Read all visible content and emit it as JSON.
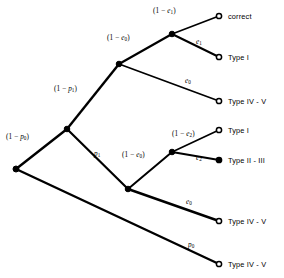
{
  "figure": {
    "type": "probability-tree",
    "title": "",
    "width": 284,
    "height": 278,
    "background": "#ffffff",
    "stroke_color": "#000000"
  },
  "nodes": [
    {
      "id": "root",
      "name": "root-node",
      "x": 16,
      "y": 169,
      "kind": "internal",
      "fill": "#000000",
      "radius": 3.0
    },
    {
      "id": "nA",
      "name": "node-after-1-minus-p0",
      "x": 67,
      "y": 129,
      "kind": "internal",
      "fill": "#000000",
      "radius": 2.8
    },
    {
      "id": "nB",
      "name": "node-after-1-minus-p1",
      "x": 119,
      "y": 64,
      "kind": "internal",
      "fill": "#000000",
      "radius": 2.8
    },
    {
      "id": "nC",
      "name": "node-after-1-minus-e0-upper",
      "x": 172,
      "y": 34,
      "kind": "internal",
      "fill": "#000000",
      "radius": 2.8
    },
    {
      "id": "nD",
      "name": "node-after-p1",
      "x": 128,
      "y": 189,
      "kind": "internal",
      "fill": "#000000",
      "radius": 2.8
    },
    {
      "id": "nE",
      "name": "node-after-1-minus-e0-lower",
      "x": 172,
      "y": 152,
      "kind": "internal",
      "fill": "#000000",
      "radius": 2.8
    },
    {
      "id": "t1",
      "name": "terminal-correct",
      "x": 219,
      "y": 16,
      "kind": "terminal",
      "fill": "#ffffff",
      "radius": 2.6
    },
    {
      "id": "t2",
      "name": "terminal-type-i-upper",
      "x": 219,
      "y": 57,
      "kind": "terminal",
      "fill": "#ffffff",
      "radius": 2.6
    },
    {
      "id": "t3",
      "name": "terminal-type-iv-v-upper",
      "x": 219,
      "y": 101,
      "kind": "terminal",
      "fill": "#ffffff",
      "radius": 2.6
    },
    {
      "id": "t4",
      "name": "terminal-type-i-lower",
      "x": 219,
      "y": 130,
      "kind": "terminal",
      "fill": "#ffffff",
      "radius": 2.6
    },
    {
      "id": "t5",
      "name": "terminal-type-ii-iii",
      "x": 219,
      "y": 160,
      "kind": "terminal",
      "fill": "#000000",
      "radius": 2.6
    },
    {
      "id": "t6",
      "name": "terminal-type-iv-v-middle",
      "x": 219,
      "y": 221,
      "kind": "terminal",
      "fill": "#ffffff",
      "radius": 2.6
    },
    {
      "id": "t7",
      "name": "terminal-type-iv-v-bottom",
      "x": 219,
      "y": 264,
      "kind": "terminal",
      "fill": "#ffffff",
      "radius": 2.6
    }
  ],
  "edges": [
    {
      "id": "e_root_nA",
      "name": "edge-root-to-node-a",
      "from": "root",
      "to": "nA",
      "width": 2.4
    },
    {
      "id": "e_root_t7",
      "name": "edge-root-to-terminal-p0",
      "from": "root",
      "to": "t7",
      "width": 2.4
    },
    {
      "id": "e_nA_nB",
      "name": "edge-node-a-to-node-b",
      "from": "nA",
      "to": "nB",
      "width": 2.4
    },
    {
      "id": "e_nA_nD",
      "name": "edge-node-a-to-node-d",
      "from": "nA",
      "to": "nD",
      "width": 2.2
    },
    {
      "id": "e_nB_nC",
      "name": "edge-node-b-to-node-c",
      "from": "nB",
      "to": "nC",
      "width": 2.2
    },
    {
      "id": "e_nB_t3",
      "name": "edge-node-b-to-type-iv-v",
      "from": "nB",
      "to": "t3",
      "width": 1.7
    },
    {
      "id": "e_nC_t1",
      "name": "edge-node-c-to-correct",
      "from": "nC",
      "to": "t1",
      "width": 1.7
    },
    {
      "id": "e_nC_t2",
      "name": "edge-node-c-to-type-i",
      "from": "nC",
      "to": "t2",
      "width": 2.0
    },
    {
      "id": "e_nD_nE",
      "name": "edge-node-d-to-node-e",
      "from": "nD",
      "to": "nE",
      "width": 2.0
    },
    {
      "id": "e_nD_t6",
      "name": "edge-node-d-to-type-iv-v",
      "from": "nD",
      "to": "t6",
      "width": 2.4
    },
    {
      "id": "e_nE_t4",
      "name": "edge-node-e-to-type-i",
      "from": "nE",
      "to": "t4",
      "width": 1.7
    },
    {
      "id": "e_nE_t5",
      "name": "edge-node-e-to-type-ii-iii",
      "from": "nE",
      "to": "t5",
      "width": 2.0
    }
  ],
  "edge_labels": [
    {
      "name": "label-1-minus-e1",
      "html": "(1 &minus; <i>e</i><sub>1</sub>)",
      "x": 153,
      "y": 8,
      "edge": "e_nC_t1"
    },
    {
      "name": "label-e1",
      "html": "<i>e</i><sub>1</sub>",
      "x": 196,
      "y": 39,
      "edge": "e_nC_t2"
    },
    {
      "name": "label-1-minus-e0-upper",
      "html": "(1 &minus; <i>e</i><sub>0</sub>)",
      "x": 107,
      "y": 35,
      "edge": "e_nB_nC"
    },
    {
      "name": "label-e0-upper",
      "html": "<i>e</i><sub>0</sub>",
      "x": 185,
      "y": 78,
      "edge": "e_nB_t3"
    },
    {
      "name": "label-1-minus-p1",
      "html": "(1 &minus; <i>p</i><sub>1</sub>)",
      "x": 54,
      "y": 86,
      "edge": "e_nA_nB"
    },
    {
      "name": "label-1-minus-p0",
      "html": "(1 &minus; <i>p</i><sub>0</sub>)",
      "x": 6,
      "y": 134,
      "edge": "e_root_nA"
    },
    {
      "name": "label-p1",
      "html": "<i>p</i><sub>1</sub>",
      "x": 94,
      "y": 151,
      "edge": "e_nA_nD"
    },
    {
      "name": "label-1-minus-e2",
      "html": "(1 &minus; <i>e</i><sub>2</sub>)",
      "x": 172,
      "y": 131,
      "edge": "e_nE_t4"
    },
    {
      "name": "label-e2",
      "html": "<i>e</i><sub>2</sub>",
      "x": 196,
      "y": 155,
      "edge": "e_nE_t5"
    },
    {
      "name": "label-1-minus-e0-lower",
      "html": "(1 &minus; <i>e</i><sub>0</sub>)",
      "x": 122,
      "y": 152,
      "edge": "e_nD_nE"
    },
    {
      "name": "label-e0-lower",
      "html": "<i>e</i><sub>0</sub>",
      "x": 186,
      "y": 199,
      "edge": "e_nD_t6"
    },
    {
      "name": "label-p0",
      "html": "<i>p</i><sub>0</sub>",
      "x": 188,
      "y": 242,
      "edge": "e_root_t7"
    }
  ],
  "terminal_labels": [
    {
      "name": "terminal-label-correct",
      "text": "correct",
      "x": 228,
      "y": 13,
      "node": "t1"
    },
    {
      "name": "terminal-label-type-i-upper",
      "text": "Type I",
      "x": 228,
      "y": 54,
      "node": "t2"
    },
    {
      "name": "terminal-label-type-iv-v-upper",
      "text": "Type IV - V",
      "x": 228,
      "y": 98,
      "node": "t3"
    },
    {
      "name": "terminal-label-type-i-lower",
      "text": "Type I",
      "x": 228,
      "y": 127,
      "node": "t4"
    },
    {
      "name": "terminal-label-type-ii-iii",
      "text": "Type II - III",
      "x": 228,
      "y": 157,
      "node": "t5"
    },
    {
      "name": "terminal-label-type-iv-v-middle",
      "text": "Type IV - V",
      "x": 228,
      "y": 218,
      "node": "t6"
    },
    {
      "name": "terminal-label-type-iv-v-bottom",
      "text": "Type IV - V",
      "x": 228,
      "y": 261,
      "node": "t7"
    }
  ]
}
